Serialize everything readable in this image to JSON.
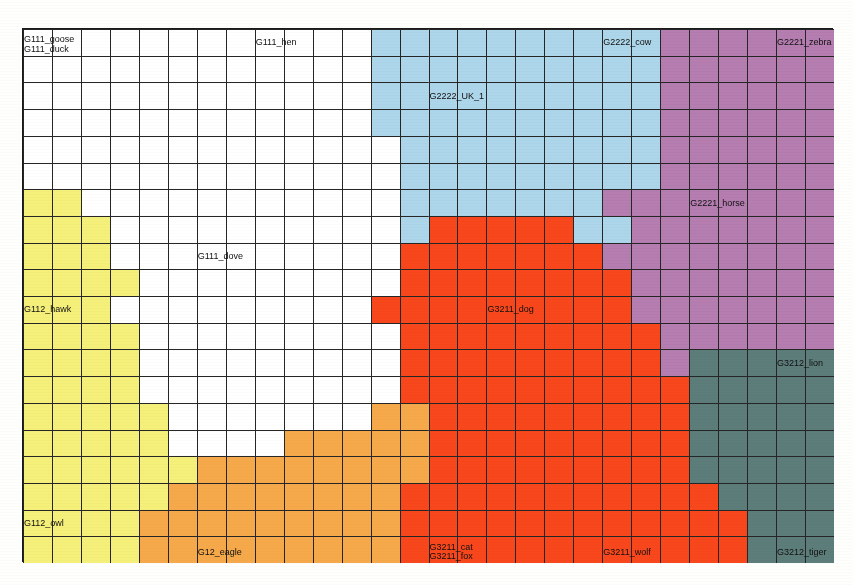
{
  "map": {
    "cols": 28,
    "rows": 20,
    "grid_line_color": "#262626",
    "border_color": "#1a1a1a"
  },
  "palette": {
    "white": "#ffffff",
    "yellow": "#f5f07a",
    "orange": "#f6a94a",
    "red": "#f8471c",
    "blue": "#aed6ea",
    "purple": "#b57db0",
    "teal": "#5d7d7b"
  },
  "clusters": [
    {
      "key": "white",
      "color": "#ffffff",
      "name": "G111 birds (white)"
    },
    {
      "key": "yellow",
      "color": "#f5f07a",
      "name": "G112 raptors (yellow)"
    },
    {
      "key": "orange",
      "color": "#f6a94a",
      "name": "G12 eagle (orange)"
    },
    {
      "key": "red",
      "color": "#f8471c",
      "name": "G3211 canines (red)"
    },
    {
      "key": "blue",
      "color": "#aed6ea",
      "name": "G2222 bovines (blue)"
    },
    {
      "key": "purple",
      "color": "#b57db0",
      "name": "G2221 equines (purple)"
    },
    {
      "key": "teal",
      "color": "#5d7d7b",
      "name": "G3212 felines (teal)"
    }
  ],
  "labels": [
    {
      "text": "G111_goose",
      "col": 0,
      "row": 0,
      "align": "left",
      "dy": -3
    },
    {
      "text": "G111_duck",
      "col": 0,
      "row": 0,
      "align": "left",
      "dy": 7
    },
    {
      "text": "G111_hen",
      "col": 8,
      "row": 0,
      "align": "left",
      "dy": 0
    },
    {
      "text": "G2222_cow",
      "col": 20,
      "row": 0,
      "align": "left",
      "dy": 0
    },
    {
      "text": "G2221_zebra",
      "col": 26,
      "row": 0,
      "align": "left",
      "dy": 0
    },
    {
      "text": "G2222_UK_1",
      "col": 14,
      "row": 2,
      "align": "left",
      "dy": 0
    },
    {
      "text": "G2221_horse",
      "col": 23,
      "row": 6,
      "align": "left",
      "dy": 0
    },
    {
      "text": "G111_dove",
      "col": 6,
      "row": 8,
      "align": "left",
      "dy": 0
    },
    {
      "text": "G3211_dog",
      "col": 16,
      "row": 10,
      "align": "left",
      "dy": 0
    },
    {
      "text": "G112_hawk",
      "col": 0,
      "row": 10,
      "align": "left",
      "dy": 0
    },
    {
      "text": "G3212_lion",
      "col": 26,
      "row": 12,
      "align": "left",
      "dy": 0
    },
    {
      "text": "G112_owl",
      "col": 0,
      "row": 18,
      "align": "left",
      "dy": 0
    },
    {
      "text": "G12_eagle",
      "col": 6,
      "row": 19,
      "align": "left",
      "dy": 2
    },
    {
      "text": "G3211_cat",
      "col": 14,
      "row": 19,
      "align": "left",
      "dy": -3
    },
    {
      "text": "G3211_fox",
      "col": 14,
      "row": 19,
      "align": "left",
      "dy": 6
    },
    {
      "text": "G3211_wolf",
      "col": 20,
      "row": 19,
      "align": "left",
      "dy": 2
    },
    {
      "text": "G3212_tiger",
      "col": 26,
      "row": 19,
      "align": "left",
      "dy": 2
    }
  ],
  "cell_map": [
    "wwwwwwwwwwwwbbbbbbbbbbpppppp",
    "wwwwwwwwwwwwbbbbbbbbbbpppppp",
    "wwwwwwwwwwwwbbbbbbbbbbpppppp",
    "wwwwwwwwwwwwbbbbbbbbbbpppppp",
    "wwwwwwwwwwwwwbbbbbbbbbpppppp",
    "wwwwwwwwwwwwwbbbbbbbbbpppppp",
    "yywwwwwwwwwwwbbbbbbbppppppppp",
    "yyywwwwwwwwwwbrrrrrbbpppppppp",
    "yyywwwwwwwwwwrrrrrrrppppppppp",
    "yyyywwwwwwwwwrrrrrrrrppppppp",
    "yyywwwwwwwwwrrrrrrrrrppppppp",
    "yyyywwwwwwwwwrrrrrrrrrpppppp",
    "yyyywwwwwwwwwrrrrrrrrrptttttt",
    "yyyywwwwwwwwwrrrrrrrrrrtttttt",
    "yyyyywwwwwwwoorrrrrrrrrtttttt",
    "yyyyywwwwooooorrrrrrrrrtttttt",
    "yyyyyyoooooooorrrrrrrrrtttttt",
    "yyyyyoooooooorrrrrrrrrrrttttt",
    "yyyyooooooooorrrrrrrrrrrrtttt",
    "yyyyooooooooorrrrrrrrrrrrtttt"
  ]
}
